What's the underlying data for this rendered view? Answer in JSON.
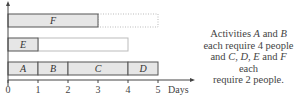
{
  "chart_data": {
    "type": "gantt",
    "xlabel": "Days",
    "x_ticks": [
      "0",
      "1",
      "2",
      "3",
      "4",
      "5"
    ],
    "xlim": [
      0,
      5
    ],
    "rows": [
      {
        "activities": [
          {
            "label": "F",
            "start": 0,
            "end": 3
          }
        ],
        "float": {
          "start": 3,
          "end": 5,
          "style": "dotted"
        }
      },
      {
        "activities": [
          {
            "label": "E",
            "start": 0,
            "end": 1
          }
        ],
        "float": {
          "start": 1,
          "end": 4,
          "style": "solid-light"
        }
      },
      {
        "activities": [
          {
            "label": "A",
            "start": 0,
            "end": 1
          },
          {
            "label": "B",
            "start": 1,
            "end": 2
          },
          {
            "label": "C",
            "start": 2,
            "end": 4
          },
          {
            "label": "D",
            "start": 4,
            "end": 5
          }
        ],
        "float": null
      }
    ],
    "colors": {
      "bar_fill": "#e6e6e6",
      "bar_stroke": "#555555",
      "axis": "#444444",
      "float": "#bbbbbb"
    }
  },
  "note": {
    "line1_pre": "Activities ",
    "a": "A",
    "and1": " and ",
    "b": "B",
    "line2": "each require 4 people",
    "line3_pre": "and ",
    "c": "C",
    "sep1": ", ",
    "d": "D",
    "sep2": ", ",
    "e": "E",
    "and2": " and ",
    "f": "F",
    "line3_post": " each",
    "line4": "require 2 people."
  }
}
